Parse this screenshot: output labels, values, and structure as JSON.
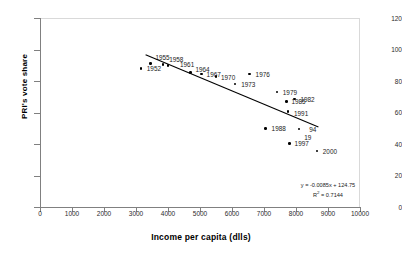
{
  "chart_data": {
    "type": "scatter",
    "title": "",
    "xlabel": "Income per capita (dlls)",
    "ylabel": "PRI's vote share",
    "xlim": [
      0,
      10000
    ],
    "ylim": [
      0,
      120
    ],
    "xticks": [
      "0",
      "1000",
      "2000",
      "3000",
      "4000",
      "5000",
      "6000",
      "7000",
      "8000",
      "9000",
      "10000"
    ],
    "yticks": [
      "0",
      "20",
      "40",
      "60",
      "80",
      "100",
      "120"
    ],
    "grid": false,
    "legend": "none",
    "series": [
      {
        "name": "PRI vote share by year",
        "points": [
          {
            "label": "1952",
            "x": 3150,
            "y": 88.0,
            "label_dx": 6,
            "label_dy": -3
          },
          {
            "label": "1955",
            "x": 3450,
            "y": 91.0,
            "label_dx": 5,
            "label_dy": -10
          },
          {
            "label": "1958",
            "x": 3850,
            "y": 90.5,
            "label_dx": 6,
            "label_dy": -8
          },
          {
            "label": "1961",
            "x": 4000,
            "y": 90.0,
            "label_dx": 12,
            "label_dy": -4
          },
          {
            "label": "1964",
            "x": 4700,
            "y": 85.5,
            "label_dx": 5,
            "label_dy": -6
          },
          {
            "label": "1967",
            "x": 5050,
            "y": 84.5,
            "label_dx": 5,
            "label_dy": -3
          },
          {
            "label": "1970",
            "x": 5500,
            "y": 83.0,
            "label_dx": 5,
            "label_dy": -2
          },
          {
            "label": "1973",
            "x": 6100,
            "y": 78.0,
            "label_dx": 6,
            "label_dy": -3
          },
          {
            "label": "1976",
            "x": 6550,
            "y": 84.5,
            "label_dx": 6,
            "label_dy": -3
          },
          {
            "label": "1979",
            "x": 7400,
            "y": 73.0,
            "label_dx": 6,
            "label_dy": -3
          },
          {
            "label": "1982",
            "x": 7950,
            "y": 68.5,
            "label_dx": 6,
            "label_dy": -3
          },
          {
            "label": "1985",
            "x": 7700,
            "y": 67.0,
            "label_dx": 5,
            "label_dy": 0
          },
          {
            "label": "1991",
            "x": 7750,
            "y": 60.5,
            "label_dx": 6,
            "label_dy": -2
          },
          {
            "label": "1988",
            "x": 7050,
            "y": 50.0,
            "label_dx": 6,
            "label_dy": -3
          },
          {
            "label": "94",
            "x": 8100,
            "y": 49.5,
            "label_dx": 10,
            "label_dy": 0
          },
          {
            "label": "19",
            "x": 8100,
            "y": 49.5,
            "label_dx": 5,
            "label_dy": 5
          },
          {
            "label": "1997",
            "x": 7800,
            "y": 40.5,
            "label_dx": 5,
            "label_dy": -3
          },
          {
            "label": "2000",
            "x": 8650,
            "y": 35.5,
            "label_dx": 6,
            "label_dy": -3
          }
        ]
      }
    ],
    "trendline": {
      "slope": -0.0085,
      "intercept": 124.75,
      "x_start": 3300,
      "x_end": 8700,
      "equation": "y = -0.0085x + 124.75",
      "r_squared_label": "R",
      "r_squared_sup": "2",
      "r_squared_value": " = 0.7144"
    },
    "colors": {
      "marker": "#000000",
      "trendline": "#000000",
      "axis": "#808080",
      "frame": "#d9d9d9",
      "text": "#1a1a1a",
      "background": "#ffffff"
    }
  }
}
